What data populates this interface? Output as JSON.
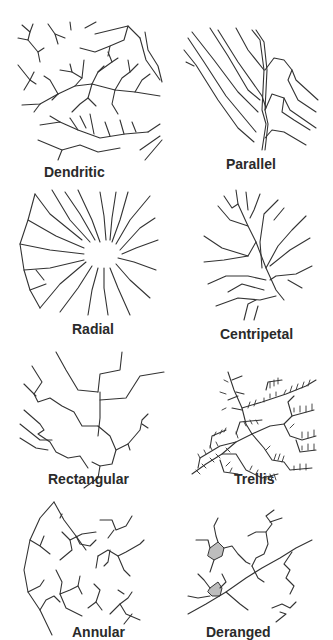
{
  "figure": {
    "stroke_color": "#333333",
    "background": "#ffffff",
    "lake_fill": "#bdbdbd"
  },
  "patterns": [
    {
      "id": "dendritic",
      "label": "Dendritic",
      "position": "row1-left"
    },
    {
      "id": "parallel",
      "label": "Parallel",
      "position": "row1-right"
    },
    {
      "id": "radial",
      "label": "Radial",
      "position": "row2-left"
    },
    {
      "id": "centripetal",
      "label": "Centripetal",
      "position": "row2-right"
    },
    {
      "id": "rectangular",
      "label": "Rectangular",
      "position": "row3-left"
    },
    {
      "id": "trellis",
      "label": "Trellis",
      "position": "row3-right"
    },
    {
      "id": "annular",
      "label": "Annular",
      "position": "row4-left"
    },
    {
      "id": "deranged",
      "label": "Deranged",
      "position": "row4-right"
    }
  ]
}
